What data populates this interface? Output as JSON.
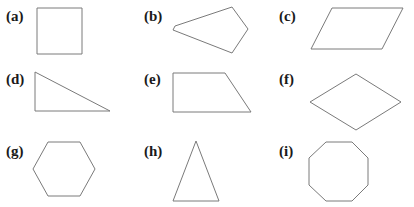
{
  "figure": {
    "items": [
      {
        "label": "(a)",
        "shape": "square",
        "points": "37,8 82,8 82,54 37,54",
        "label_pos": [
          6,
          9
        ]
      },
      {
        "label": "(b)",
        "shape": "pentagon",
        "points": "175,26 232,7 248,29 232,53 173,30",
        "label_pos": [
          144,
          9
        ]
      },
      {
        "label": "(c)",
        "shape": "parallelogram",
        "points": "332,8 403,8 382,49 311,49",
        "label_pos": [
          279,
          9
        ]
      },
      {
        "label": "(d)",
        "shape": "right-triangle",
        "points": "35,72 35,111 110,111",
        "label_pos": [
          6,
          72
        ]
      },
      {
        "label": "(e)",
        "shape": "trapezoid",
        "points": "173,73 225,73 251,112 173,112",
        "label_pos": [
          144,
          72
        ]
      },
      {
        "label": "(f)",
        "shape": "rhombus",
        "points": "310,102 356,74 401,102 356,130",
        "label_pos": [
          279,
          72
        ]
      },
      {
        "label": "(g)",
        "shape": "hexagon",
        "points": "48,142 80,142 95,169 80,196 48,196 33,169",
        "label_pos": [
          6,
          144
        ]
      },
      {
        "label": "(h)",
        "shape": "isosceles-triangle",
        "points": "196,141 173,201 219,201",
        "label_pos": [
          144,
          144
        ]
      },
      {
        "label": "(i)",
        "shape": "octagon",
        "points": "326,142 352,142 368,158 368,185 352,201 326,201 309,185 309,158",
        "label_pos": [
          279,
          144
        ]
      }
    ],
    "stroke_color": "#7a7a7a"
  }
}
